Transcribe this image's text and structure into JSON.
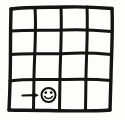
{
  "image": {
    "title": "Hand-drawn 4x4 grid sketch",
    "style": "hand-drawn ink sketch",
    "background_color": "#fdfdfc",
    "ink_color": "#141414",
    "width": 125,
    "height": 120
  },
  "grid": {
    "name": "gridworld-grid",
    "columns": 4,
    "rows": 4,
    "cell_count": 16,
    "vertical_line_x": [
      11,
      36,
      61,
      87,
      112
    ],
    "horizontal_line_y": [
      8,
      31,
      54,
      80,
      110
    ],
    "border_stroke_width": 3.4,
    "inner_stroke_width": 3.0
  },
  "markers": [
    {
      "name": "arrow-right-icon",
      "glyph": "→",
      "cell_row": 4,
      "cell_col": 1,
      "x": 24,
      "y": 95,
      "description": "arrow pointing right toward the smiley face"
    },
    {
      "name": "smiley-face-icon",
      "glyph": "☺",
      "cell_row": 4,
      "cell_col": 1,
      "x": 48,
      "y": 95,
      "radius": 7,
      "description": "circled smiley face goal marker"
    }
  ],
  "cells": [
    {
      "row": 1,
      "col": 1,
      "content": ""
    },
    {
      "row": 1,
      "col": 2,
      "content": ""
    },
    {
      "row": 1,
      "col": 3,
      "content": ""
    },
    {
      "row": 1,
      "col": 4,
      "content": ""
    },
    {
      "row": 2,
      "col": 1,
      "content": ""
    },
    {
      "row": 2,
      "col": 2,
      "content": ""
    },
    {
      "row": 2,
      "col": 3,
      "content": ""
    },
    {
      "row": 2,
      "col": 4,
      "content": ""
    },
    {
      "row": 3,
      "col": 1,
      "content": ""
    },
    {
      "row": 3,
      "col": 2,
      "content": ""
    },
    {
      "row": 3,
      "col": 3,
      "content": ""
    },
    {
      "row": 3,
      "col": 4,
      "content": ""
    },
    {
      "row": 4,
      "col": 1,
      "content": "→ ☺"
    },
    {
      "row": 4,
      "col": 2,
      "content": ""
    },
    {
      "row": 4,
      "col": 3,
      "content": ""
    },
    {
      "row": 4,
      "col": 4,
      "content": ""
    }
  ]
}
